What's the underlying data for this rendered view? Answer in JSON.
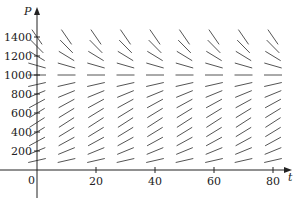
{
  "chart_data": {
    "type": "slope_field",
    "title": "",
    "xlabel": "t",
    "ylabel": "P",
    "x_ticks": [
      0,
      20,
      40,
      60,
      80
    ],
    "y_ticks": [
      200,
      400,
      600,
      800,
      1000,
      1200,
      1400
    ],
    "xlim": [
      0,
      85
    ],
    "ylim": [
      0,
      1500
    ],
    "grid": false,
    "equilibrium": 1000,
    "sample_t": [
      0,
      10,
      20,
      30,
      40,
      50,
      60,
      70,
      80
    ],
    "sample_P": [
      100,
      200,
      300,
      400,
      500,
      600,
      700,
      800,
      900,
      1000,
      1100,
      1200,
      1300,
      1400
    ]
  },
  "labels": {
    "x_axis": "t",
    "y_axis": "P",
    "origin": "0",
    "x_tick_labels": [
      "20",
      "40",
      "60",
      "80"
    ],
    "y_tick_labels": [
      "200",
      "400",
      "600",
      "800",
      "1000",
      "1200",
      "1400"
    ]
  },
  "colors": {
    "axis": "#222222",
    "segment": "#555555"
  }
}
